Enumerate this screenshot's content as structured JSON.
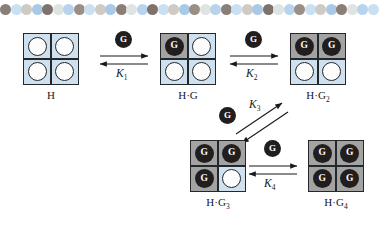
{
  "figure": {
    "type": "chemical-equilibrium-scheme"
  },
  "bead_band": {
    "name": "decorative-bead-border",
    "bead_count": 36,
    "palette": [
      "#8a7f78",
      "#c9e0f2",
      "#cfcbc4",
      "#a9c9e6",
      "#7d736c",
      "#dfe3e2",
      "#b7d4ec",
      "#9a8f86"
    ],
    "sequence": [
      "#8a7f78",
      "#c9e0f2",
      "#cfcbc4",
      "#a9c9e6",
      "#7d736c",
      "#dfe3e2",
      "#b7d4ec",
      "#9a8f86",
      "#c9e0f2",
      "#cfcbc4",
      "#a9c9e6",
      "#8a7f78",
      "#dfe3e2",
      "#b7d4ec",
      "#7d736c",
      "#c9e0f2",
      "#cfcbc4",
      "#a9c9e6",
      "#9a8f86",
      "#dfe3e2",
      "#b7d4ec",
      "#8a7f78",
      "#c9e0f2",
      "#cfcbc4",
      "#a9c9e6",
      "#7d736c",
      "#dfe3e2",
      "#b7d4ec",
      "#9a8f86",
      "#c9e0f2",
      "#cfcbc4",
      "#a9c9e6",
      "#8a7f78",
      "#dfe3e2",
      "#b7d4ec",
      "#c9e0f2"
    ]
  },
  "colors": {
    "empty_site": "#cfe0ee",
    "occupied_site": "#a3a3a3",
    "guest_fill": "#221e1e",
    "ring_fill": "#fdfdfd",
    "outline": "#23282c",
    "text": "#17191c"
  },
  "guest_label": "G",
  "species": [
    {
      "id": "H",
      "name": "host-free",
      "caption_html": "H",
      "caption_text": "H",
      "sites": [
        "empty",
        "empty",
        "empty",
        "empty"
      ],
      "bound_count": 0
    },
    {
      "id": "HG",
      "name": "host-one-guest",
      "caption_html": "H&middot;G",
      "caption_text": "H·G",
      "sites": [
        "filled",
        "empty",
        "empty",
        "empty"
      ],
      "bound_count": 1
    },
    {
      "id": "HG2",
      "name": "host-two-guests",
      "caption_html": "H&middot;G<sub>2</sub>",
      "caption_text": "H·G2",
      "sites": [
        "filled",
        "filled",
        "empty",
        "empty"
      ],
      "bound_count": 2
    },
    {
      "id": "HG3",
      "name": "host-three-guests",
      "caption_html": "H&middot;G<sub>3</sub>",
      "caption_text": "H·G3",
      "sites": [
        "filled",
        "filled",
        "filled",
        "empty"
      ],
      "bound_count": 3
    },
    {
      "id": "HG4",
      "name": "host-four-guests",
      "caption_html": "H&middot;G<sub>4</sub>",
      "caption_text": "H·G4",
      "sites": [
        "filled",
        "filled",
        "filled",
        "filled"
      ],
      "bound_count": 4
    }
  ],
  "equilibria": [
    {
      "id": "K1",
      "label_html": "K<sub>1</sub>",
      "label_text": "K1",
      "from": "H",
      "to": "HG",
      "guest_added": "G",
      "orientation": "horizontal"
    },
    {
      "id": "K2",
      "label_html": "K<sub>2</sub>",
      "label_text": "K2",
      "from": "HG",
      "to": "HG2",
      "guest_added": "G",
      "orientation": "horizontal"
    },
    {
      "id": "K3",
      "label_html": "K<sub>3</sub>",
      "label_text": "K3",
      "from": "HG2",
      "to": "HG3",
      "guest_added": "G",
      "orientation": "diagonal"
    },
    {
      "id": "K4",
      "label_html": "K<sub>4</sub>",
      "label_text": "K4",
      "from": "HG3",
      "to": "HG4",
      "guest_added": "G",
      "orientation": "horizontal"
    }
  ]
}
